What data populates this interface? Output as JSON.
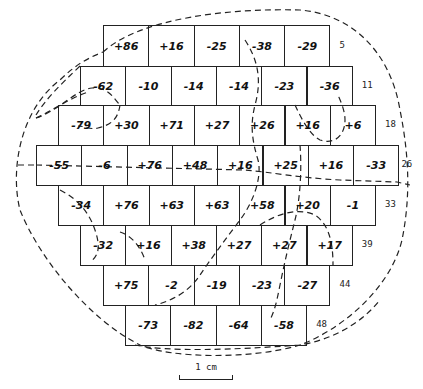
{
  "diagram": {
    "type": "hexagonal-offset-grid-map",
    "rows": [
      {
        "cells": [
          "+86",
          "+16",
          "-25",
          "-38",
          "-29"
        ],
        "cumulative_label": "5"
      },
      {
        "cells": [
          "-62",
          "-10",
          "-14",
          "-14",
          "-23",
          "-36"
        ],
        "cumulative_label": "11"
      },
      {
        "cells": [
          "-79",
          "+30",
          "+71",
          "+27",
          "+26",
          "+16",
          "+6"
        ],
        "cumulative_label": "18"
      },
      {
        "cells": [
          "-55",
          "-6",
          "+76",
          "+48",
          "+16",
          "+25",
          "+16",
          "-33"
        ],
        "cumulative_label": "26"
      },
      {
        "cells": [
          "-34",
          "+76",
          "+63",
          "+63",
          "+58",
          "+20",
          "-1"
        ],
        "cumulative_label": "33"
      },
      {
        "cells": [
          "-32",
          "+16",
          "+38",
          "+27",
          "+27",
          "+17"
        ],
        "cumulative_label": "39"
      },
      {
        "cells": [
          "+75",
          "-2",
          "-19",
          "-23",
          "-27"
        ],
        "cumulative_label": "44"
      },
      {
        "cells": [
          "-73",
          "-82",
          "-64",
          "-58"
        ],
        "cumulative_label": "48"
      }
    ],
    "scale_bar": {
      "label": "1 cm"
    },
    "line_color": "#222222",
    "background": "#ffffff"
  }
}
